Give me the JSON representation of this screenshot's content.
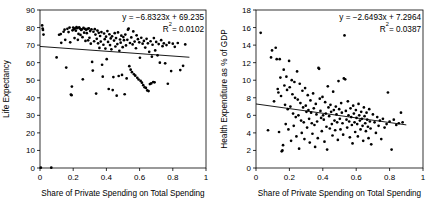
{
  "figure": {
    "background": "#ffffff",
    "marker_color": "#000000",
    "axis_color": "#000000",
    "width": 435,
    "height": 206
  },
  "chart_data": [
    {
      "type": "scatter",
      "panel": "left",
      "title": "",
      "xlabel": "Share of Private Spending on Total Spending",
      "ylabel": "Life Expectancy",
      "xlim": [
        0,
        1
      ],
      "ylim": [
        0,
        90
      ],
      "xticks": [
        "0",
        "0.2",
        "0.4",
        "0.6",
        "0.8",
        "1"
      ],
      "xtick_values": [
        0,
        0.2,
        0.4,
        0.6,
        0.8,
        1
      ],
      "yticks": [
        "0",
        "10",
        "20",
        "30",
        "40",
        "50",
        "60",
        "70",
        "80",
        "90"
      ],
      "ytick_values": [
        0,
        10,
        20,
        30,
        40,
        50,
        60,
        70,
        80,
        90
      ],
      "grid": false,
      "legend": "none",
      "annotations": {
        "equation": "y = −6.8323x + 69.235",
        "r_squared_label": "R",
        "r_squared_exponent": "2",
        "r_squared_value": "= 0.0102",
        "r_squared_full": "R² = 0.0102"
      },
      "trendline": {
        "slope": -6.8323,
        "intercept": 69.235,
        "x_start": 0.0,
        "x_end": 0.9
      },
      "points": [
        [
          0.013,
          81.2
        ],
        [
          0.016,
          79.4
        ],
        [
          0.018,
          78.6
        ],
        [
          0.021,
          76.0
        ],
        [
          0.005,
          0.2
        ],
        [
          0.068,
          0.2
        ],
        [
          0.1,
          63.0
        ],
        [
          0.115,
          75.9
        ],
        [
          0.125,
          76.3
        ],
        [
          0.128,
          71.3
        ],
        [
          0.142,
          77.6
        ],
        [
          0.148,
          78.8
        ],
        [
          0.152,
          73.0
        ],
        [
          0.158,
          57.2
        ],
        [
          0.165,
          79.3
        ],
        [
          0.172,
          77.4
        ],
        [
          0.178,
          80.0
        ],
        [
          0.182,
          71.6
        ],
        [
          0.186,
          41.8
        ],
        [
          0.19,
          41.5
        ],
        [
          0.192,
          46.4
        ],
        [
          0.196,
          78.4
        ],
        [
          0.2,
          80.0
        ],
        [
          0.205,
          79.1
        ],
        [
          0.208,
          74.0
        ],
        [
          0.212,
          79.6
        ],
        [
          0.216,
          78.2
        ],
        [
          0.22,
          80.3
        ],
        [
          0.224,
          79.7
        ],
        [
          0.228,
          73.0
        ],
        [
          0.232,
          76.4
        ],
        [
          0.236,
          80.1
        ],
        [
          0.24,
          79.4
        ],
        [
          0.244,
          75.8
        ],
        [
          0.248,
          78.6
        ],
        [
          0.252,
          79.0
        ],
        [
          0.256,
          74.5
        ],
        [
          0.258,
          50.5
        ],
        [
          0.262,
          79.8
        ],
        [
          0.266,
          77.1
        ],
        [
          0.27,
          79.3
        ],
        [
          0.274,
          72.4
        ],
        [
          0.278,
          78.7
        ],
        [
          0.282,
          76.8
        ],
        [
          0.286,
          79.2
        ],
        [
          0.29,
          72.7
        ],
        [
          0.294,
          79.5
        ],
        [
          0.298,
          74.2
        ],
        [
          0.302,
          78.0
        ],
        [
          0.306,
          70.8
        ],
        [
          0.31,
          79.0
        ],
        [
          0.314,
          60.4
        ],
        [
          0.318,
          55.5
        ],
        [
          0.322,
          77.6
        ],
        [
          0.326,
          72.2
        ],
        [
          0.33,
          79.1
        ],
        [
          0.334,
          76.0
        ],
        [
          0.338,
          42.4
        ],
        [
          0.342,
          73.6
        ],
        [
          0.346,
          78.3
        ],
        [
          0.35,
          71.0
        ],
        [
          0.354,
          77.0
        ],
        [
          0.358,
          68.4
        ],
        [
          0.362,
          75.2
        ],
        [
          0.366,
          72.0
        ],
        [
          0.37,
          77.4
        ],
        [
          0.374,
          58.8
        ],
        [
          0.378,
          52.0
        ],
        [
          0.382,
          70.2
        ],
        [
          0.386,
          76.6
        ],
        [
          0.39,
          73.4
        ],
        [
          0.394,
          68.0
        ],
        [
          0.398,
          74.8
        ],
        [
          0.402,
          62.0
        ],
        [
          0.406,
          78.0
        ],
        [
          0.41,
          71.8
        ],
        [
          0.414,
          45.0
        ],
        [
          0.418,
          76.2
        ],
        [
          0.422,
          70.0
        ],
        [
          0.426,
          73.8
        ],
        [
          0.43,
          67.6
        ],
        [
          0.434,
          75.0
        ],
        [
          0.438,
          44.4
        ],
        [
          0.442,
          51.8
        ],
        [
          0.446,
          72.6
        ],
        [
          0.45,
          76.8
        ],
        [
          0.454,
          69.2
        ],
        [
          0.458,
          74.0
        ],
        [
          0.462,
          41.2
        ],
        [
          0.466,
          70.6
        ],
        [
          0.47,
          77.2
        ],
        [
          0.474,
          52.4
        ],
        [
          0.478,
          66.8
        ],
        [
          0.482,
          73.2
        ],
        [
          0.486,
          71.4
        ],
        [
          0.49,
          75.4
        ],
        [
          0.494,
          53.0
        ],
        [
          0.498,
          68.8
        ],
        [
          0.502,
          74.6
        ],
        [
          0.506,
          72.8
        ],
        [
          0.51,
          42.0
        ],
        [
          0.514,
          76.0
        ],
        [
          0.518,
          69.8
        ],
        [
          0.522,
          51.0
        ],
        [
          0.526,
          73.0
        ],
        [
          0.53,
          78.8
        ],
        [
          0.534,
          79.4
        ],
        [
          0.538,
          58.0
        ],
        [
          0.542,
          71.2
        ],
        [
          0.546,
          56.0
        ],
        [
          0.55,
          74.4
        ],
        [
          0.554,
          54.6
        ],
        [
          0.558,
          70.4
        ],
        [
          0.562,
          77.8
        ],
        [
          0.566,
          53.4
        ],
        [
          0.57,
          72.0
        ],
        [
          0.574,
          52.6
        ],
        [
          0.578,
          68.2
        ],
        [
          0.582,
          75.6
        ],
        [
          0.586,
          51.4
        ],
        [
          0.59,
          73.4
        ],
        [
          0.594,
          50.4
        ],
        [
          0.598,
          71.6
        ],
        [
          0.602,
          62.8
        ],
        [
          0.606,
          49.6
        ],
        [
          0.61,
          74.2
        ],
        [
          0.614,
          48.6
        ],
        [
          0.618,
          70.8
        ],
        [
          0.622,
          47.2
        ],
        [
          0.626,
          72.4
        ],
        [
          0.63,
          46.0
        ],
        [
          0.634,
          68.6
        ],
        [
          0.638,
          45.6
        ],
        [
          0.642,
          73.6
        ],
        [
          0.646,
          44.2
        ],
        [
          0.65,
          71.0
        ],
        [
          0.654,
          43.8
        ],
        [
          0.658,
          66.2
        ],
        [
          0.662,
          47.8
        ],
        [
          0.666,
          72.2
        ],
        [
          0.67,
          48.2
        ],
        [
          0.674,
          63.4
        ],
        [
          0.678,
          70.2
        ],
        [
          0.682,
          49.0
        ],
        [
          0.686,
          74.0
        ],
        [
          0.69,
          48.8
        ],
        [
          0.694,
          67.0
        ],
        [
          0.7,
          71.8
        ],
        [
          0.708,
          64.2
        ],
        [
          0.715,
          70.6
        ],
        [
          0.722,
          60.0
        ],
        [
          0.73,
          72.8
        ],
        [
          0.738,
          69.4
        ],
        [
          0.746,
          71.0
        ],
        [
          0.754,
          59.6
        ],
        [
          0.762,
          70.0
        ],
        [
          0.77,
          48.0
        ],
        [
          0.778,
          71.4
        ],
        [
          0.79,
          55.2
        ],
        [
          0.8,
          70.8
        ],
        [
          0.812,
          69.0
        ],
        [
          0.83,
          71.2
        ],
        [
          0.845,
          55.8
        ],
        [
          0.862,
          58.2
        ],
        [
          0.875,
          70.4
        ]
      ]
    },
    {
      "type": "scatter",
      "panel": "right",
      "title": "",
      "xlabel": "Share of Private Spending on Total Spending",
      "ylabel": "Health Expenditure as % of GDP",
      "xlim": [
        0,
        1
      ],
      "ylim": [
        0,
        18
      ],
      "xticks": [
        "0",
        "0.2",
        "0.4",
        "0.6",
        "0.8",
        "1"
      ],
      "xtick_values": [
        0,
        0.2,
        0.4,
        0.6,
        0.8,
        1
      ],
      "yticks": [
        "0",
        "2",
        "4",
        "6",
        "8",
        "10",
        "12",
        "14",
        "16",
        "18"
      ],
      "ytick_values": [
        0,
        2,
        4,
        6,
        8,
        10,
        12,
        14,
        16,
        18
      ],
      "grid": false,
      "legend": "none",
      "annotations": {
        "equation": "y = −2.6493x + 7.2964",
        "r_squared_label": "R",
        "r_squared_exponent": "2",
        "r_squared_value": "= 0.0387",
        "r_squared_full": "R² = 0.0387"
      },
      "trendline": {
        "slope": -2.6493,
        "intercept": 7.2964,
        "x_start": 0.0,
        "x_end": 0.9
      },
      "points": [
        [
          0.028,
          15.4
        ],
        [
          0.072,
          4.3
        ],
        [
          0.09,
          12.6
        ],
        [
          0.096,
          13.4
        ],
        [
          0.108,
          7.6
        ],
        [
          0.118,
          13.7
        ],
        [
          0.124,
          12.4
        ],
        [
          0.13,
          9.0
        ],
        [
          0.134,
          8.6
        ],
        [
          0.138,
          4.1
        ],
        [
          0.142,
          12.4
        ],
        [
          0.146,
          10.3
        ],
        [
          0.15,
          8.2
        ],
        [
          0.154,
          1.9
        ],
        [
          0.158,
          2.0
        ],
        [
          0.162,
          2.6
        ],
        [
          0.166,
          11.2
        ],
        [
          0.17,
          9.4
        ],
        [
          0.174,
          7.2
        ],
        [
          0.178,
          5.0
        ],
        [
          0.182,
          10.4
        ],
        [
          0.186,
          8.9
        ],
        [
          0.19,
          6.7
        ],
        [
          0.194,
          4.4
        ],
        [
          0.198,
          12.2
        ],
        [
          0.202,
          9.2
        ],
        [
          0.206,
          7.0
        ],
        [
          0.21,
          3.1
        ],
        [
          0.214,
          10.0
        ],
        [
          0.218,
          8.4
        ],
        [
          0.222,
          6.2
        ],
        [
          0.226,
          4.8
        ],
        [
          0.23,
          9.8
        ],
        [
          0.234,
          8.0
        ],
        [
          0.238,
          5.8
        ],
        [
          0.242,
          3.6
        ],
        [
          0.246,
          11.0
        ],
        [
          0.25,
          7.8
        ],
        [
          0.254,
          6.0
        ],
        [
          0.258,
          2.2
        ],
        [
          0.262,
          9.6
        ],
        [
          0.266,
          7.4
        ],
        [
          0.27,
          5.4
        ],
        [
          0.274,
          4.0
        ],
        [
          0.278,
          8.8
        ],
        [
          0.282,
          6.9
        ],
        [
          0.286,
          5.2
        ],
        [
          0.29,
          3.3
        ],
        [
          0.294,
          9.1
        ],
        [
          0.298,
          7.1
        ],
        [
          0.302,
          6.4
        ],
        [
          0.306,
          4.6
        ],
        [
          0.31,
          8.3
        ],
        [
          0.314,
          6.6
        ],
        [
          0.318,
          5.6
        ],
        [
          0.322,
          2.9
        ],
        [
          0.326,
          7.7
        ],
        [
          0.33,
          6.3
        ],
        [
          0.334,
          5.1
        ],
        [
          0.338,
          3.9
        ],
        [
          0.342,
          8.5
        ],
        [
          0.346,
          6.8
        ],
        [
          0.35,
          4.9
        ],
        [
          0.354,
          2.4
        ],
        [
          0.358,
          7.3
        ],
        [
          0.362,
          6.1
        ],
        [
          0.366,
          5.3
        ],
        [
          0.37,
          3.4
        ],
        [
          0.374,
          11.4
        ],
        [
          0.378,
          11.3
        ],
        [
          0.382,
          7.9
        ],
        [
          0.386,
          6.5
        ],
        [
          0.39,
          5.7
        ],
        [
          0.394,
          4.2
        ],
        [
          0.398,
          8.1
        ],
        [
          0.402,
          6.0
        ],
        [
          0.406,
          5.5
        ],
        [
          0.41,
          3.0
        ],
        [
          0.414,
          7.5
        ],
        [
          0.418,
          6.2
        ],
        [
          0.422,
          4.7
        ],
        [
          0.426,
          2.1
        ],
        [
          0.43,
          9.3
        ],
        [
          0.434,
          6.9
        ],
        [
          0.438,
          5.9
        ],
        [
          0.442,
          4.5
        ],
        [
          0.446,
          7.2
        ],
        [
          0.45,
          6.4
        ],
        [
          0.454,
          5.0
        ],
        [
          0.458,
          3.7
        ],
        [
          0.462,
          8.7
        ],
        [
          0.466,
          6.6
        ],
        [
          0.47,
          5.4
        ],
        [
          0.474,
          4.3
        ],
        [
          0.478,
          7.0
        ],
        [
          0.482,
          6.1
        ],
        [
          0.486,
          5.2
        ],
        [
          0.49,
          3.2
        ],
        [
          0.494,
          9.9
        ],
        [
          0.498,
          6.7
        ],
        [
          0.502,
          5.6
        ],
        [
          0.506,
          4.4
        ],
        [
          0.51,
          7.4
        ],
        [
          0.514,
          6.3
        ],
        [
          0.518,
          5.1
        ],
        [
          0.522,
          3.8
        ],
        [
          0.526,
          10.2
        ],
        [
          0.53,
          15.1
        ],
        [
          0.534,
          10.1
        ],
        [
          0.538,
          6.5
        ],
        [
          0.542,
          5.5
        ],
        [
          0.546,
          4.6
        ],
        [
          0.55,
          7.6
        ],
        [
          0.554,
          6.0
        ],
        [
          0.558,
          5.3
        ],
        [
          0.562,
          3.5
        ],
        [
          0.566,
          6.8
        ],
        [
          0.57,
          5.8
        ],
        [
          0.574,
          4.9
        ],
        [
          0.578,
          2.8
        ],
        [
          0.582,
          7.1
        ],
        [
          0.586,
          6.2
        ],
        [
          0.59,
          5.2
        ],
        [
          0.594,
          4.1
        ],
        [
          0.598,
          6.6
        ],
        [
          0.602,
          5.7
        ],
        [
          0.606,
          5.0
        ],
        [
          0.61,
          3.6
        ],
        [
          0.614,
          7.3
        ],
        [
          0.618,
          6.0
        ],
        [
          0.622,
          5.4
        ],
        [
          0.626,
          4.4
        ],
        [
          0.63,
          6.4
        ],
        [
          0.634,
          5.6
        ],
        [
          0.638,
          4.8
        ],
        [
          0.642,
          3.1
        ],
        [
          0.646,
          6.9
        ],
        [
          0.65,
          5.9
        ],
        [
          0.654,
          5.1
        ],
        [
          0.658,
          4.2
        ],
        [
          0.662,
          6.3
        ],
        [
          0.666,
          5.5
        ],
        [
          0.67,
          4.7
        ],
        [
          0.674,
          3.4
        ],
        [
          0.678,
          6.7
        ],
        [
          0.682,
          5.3
        ],
        [
          0.686,
          4.5
        ],
        [
          0.69,
          2.7
        ],
        [
          0.7,
          6.1
        ],
        [
          0.71,
          5.2
        ],
        [
          0.718,
          4.0
        ],
        [
          0.726,
          5.8
        ],
        [
          0.734,
          4.8
        ],
        [
          0.742,
          5.4
        ],
        [
          0.75,
          3.3
        ],
        [
          0.76,
          5.6
        ],
        [
          0.77,
          4.6
        ],
        [
          0.782,
          5.0
        ],
        [
          0.79,
          8.6
        ],
        [
          0.8,
          5.3
        ],
        [
          0.812,
          2.1
        ],
        [
          0.825,
          5.5
        ],
        [
          0.84,
          4.9
        ],
        [
          0.855,
          5.1
        ],
        [
          0.868,
          6.3
        ],
        [
          0.878,
          5.2
        ]
      ]
    }
  ]
}
